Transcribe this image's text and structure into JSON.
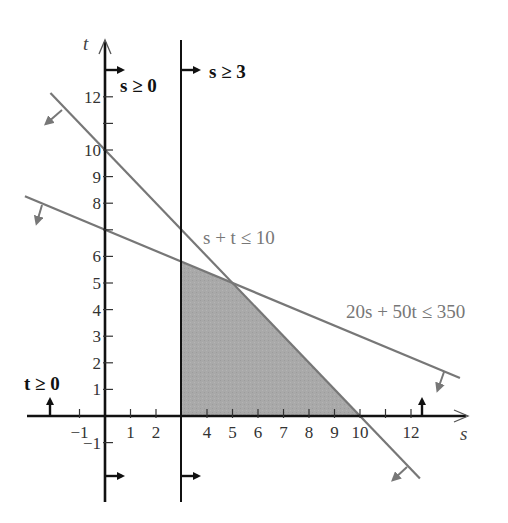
{
  "chart_data": {
    "type": "line",
    "title": "",
    "xlabel": "s",
    "ylabel": "t",
    "xlim": [
      -3,
      14
    ],
    "ylim": [
      -3.3,
      14
    ],
    "grid": false,
    "x_ticks": [
      -1,
      1,
      2,
      3,
      4,
      5,
      6,
      7,
      8,
      9,
      10,
      11,
      12
    ],
    "x_tick_labels": [
      {
        "value": -1,
        "label": "−1"
      },
      {
        "value": 1,
        "label": "1"
      },
      {
        "value": 2,
        "label": "2"
      },
      {
        "value": 4,
        "label": "4"
      },
      {
        "value": 5,
        "label": "5"
      },
      {
        "value": 6,
        "label": "6"
      },
      {
        "value": 7,
        "label": "7"
      },
      {
        "value": 8,
        "label": "8"
      },
      {
        "value": 9,
        "label": "9"
      },
      {
        "value": 10,
        "label": "10"
      },
      {
        "value": 12,
        "label": "12"
      }
    ],
    "y_ticks": [
      -1,
      1,
      2,
      3,
      4,
      5,
      6,
      7,
      8,
      9,
      10,
      11,
      12
    ],
    "y_tick_labels": [
      {
        "value": -1,
        "label": "−1"
      },
      {
        "value": 1,
        "label": "1"
      },
      {
        "value": 2,
        "label": "2"
      },
      {
        "value": 3,
        "label": "3"
      },
      {
        "value": 4,
        "label": "4"
      },
      {
        "value": 5,
        "label": "5"
      },
      {
        "value": 6,
        "label": "6"
      },
      {
        "value": 8,
        "label": "8"
      },
      {
        "value": 9,
        "label": "9"
      },
      {
        "value": 10,
        "label": "10"
      },
      {
        "value": 12,
        "label": "12"
      }
    ],
    "constraints": [
      {
        "id": "s_ge_0",
        "label": "s ≥ 0",
        "type": "vertical",
        "s": 0,
        "color": "#111111"
      },
      {
        "id": "s_ge_3",
        "label": "s ≥ 3",
        "type": "vertical",
        "s": 3,
        "color": "#111111"
      },
      {
        "id": "t_ge_0",
        "label": "t ≥ 0",
        "type": "horizontal",
        "t": 0,
        "color": "#111111"
      },
      {
        "id": "s_plus_t",
        "label": "s + t ≤ 10",
        "type": "line",
        "equation": "s + t = 10",
        "from": [
          -2.14,
          12.14
        ],
        "to": [
          12.35,
          -2.35
        ],
        "color": "#777777"
      },
      {
        "id": "cost",
        "label": "20s + 50t ≤ 350",
        "type": "line",
        "equation": "20s + 50t = 350",
        "from": [
          -3.14,
          8.26
        ],
        "to": [
          13.92,
          1.43
        ],
        "color": "#777777"
      }
    ],
    "feasible_region": {
      "vertices": [
        [
          3,
          0
        ],
        [
          3,
          5.8
        ],
        [
          5,
          5
        ],
        [
          10,
          0
        ]
      ],
      "fill": "#a9a9a9"
    },
    "intersections": [
      {
        "s": 5,
        "t": 5
      },
      {
        "s": 3,
        "t": 5.8
      },
      {
        "s": 3,
        "t": 7
      },
      {
        "s": 10,
        "t": 0
      },
      {
        "s": 0,
        "t": 7
      },
      {
        "s": 0,
        "t": 10
      }
    ]
  },
  "labels": {
    "axis_s": "s",
    "axis_t": "t",
    "s_ge_0": "s ≥ 0",
    "s_ge_3": "s ≥ 3",
    "t_ge_0": "t ≥ 0",
    "s_plus_t": "s + t ≤ 10",
    "cost": "20s + 50t ≤ 350"
  },
  "colors": {
    "axis": "#111111",
    "constraint_line": "#777777",
    "feasible_fill": "#a9a9a9",
    "text": "#333333"
  }
}
